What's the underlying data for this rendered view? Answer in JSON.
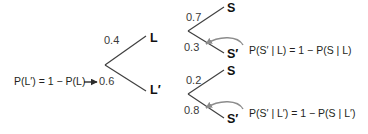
{
  "diagram": {
    "colors": {
      "branch": "#3f3f3f",
      "text": "#231f20",
      "prob_text": "#3a3a3a",
      "curved_arrow": "#8c8c8c",
      "straight_arrow": "#2b2b2b",
      "background": "#ffffff"
    },
    "root_annotation": {
      "text": "P(L′) = 1 − P(L)",
      "arrow": "right-arrow-icon"
    },
    "first_level": [
      {
        "prob": "0.4",
        "node": "L"
      },
      {
        "prob": "0.6",
        "node": "L′"
      }
    ],
    "second_level_upper": [
      {
        "prob": "0.7",
        "node": "S"
      },
      {
        "prob": "0.3",
        "node": "S′"
      }
    ],
    "second_level_lower": [
      {
        "prob": "0.2",
        "node": "S"
      },
      {
        "prob": "0.8",
        "node": "S′"
      }
    ],
    "annotations": [
      {
        "text": "P(S′ | L) = 1 − P(S | L)",
        "arrow": "curved-arrow-icon"
      },
      {
        "text": "P(S′ | L′) = 1 − P(S | L′)",
        "arrow": "curved-arrow-icon"
      }
    ]
  }
}
